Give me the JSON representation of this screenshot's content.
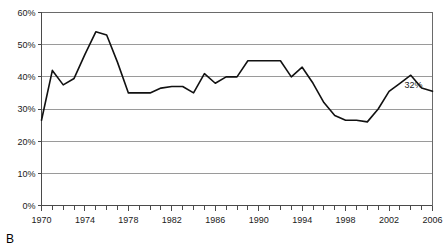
{
  "figure": {
    "panel_label": "B"
  },
  "annotations": [
    {
      "name": "endpoint-value-label",
      "text": "32%",
      "x_year": 2006,
      "y_value": 36.5
    }
  ],
  "chart_data": {
    "type": "line",
    "title": "",
    "xlabel": "",
    "ylabel": "",
    "xlim": [
      1970,
      2006
    ],
    "ylim": [
      0,
      60
    ],
    "grid": true,
    "grid_axis": "y",
    "legend": false,
    "y_ticks": [
      0,
      10,
      20,
      30,
      40,
      50,
      60
    ],
    "y_tick_labels": [
      "0%",
      "10%",
      "20%",
      "30%",
      "40%",
      "50%",
      "60%"
    ],
    "x_ticks": [
      1970,
      1974,
      1978,
      1982,
      1986,
      1990,
      1994,
      1998,
      2002,
      2006
    ],
    "x_tick_labels": [
      "1970",
      "1974",
      "1978",
      "1982",
      "1986",
      "1990",
      "1994",
      "1998",
      "2002",
      "2006"
    ],
    "x_minor_tick_interval": 1,
    "x": [
      1970,
      1971,
      1972,
      1973,
      1974,
      1975,
      1976,
      1977,
      1978,
      1979,
      1980,
      1981,
      1982,
      1983,
      1984,
      1985,
      1986,
      1987,
      1988,
      1989,
      1990,
      1991,
      1992,
      1993,
      1994,
      1995,
      1996,
      1997,
      1998,
      1999,
      2000,
      2001,
      2002,
      2003,
      2004,
      2005,
      2006
    ],
    "values": [
      26.5,
      42.0,
      37.5,
      39.5,
      47.0,
      54.0,
      53.0,
      44.5,
      35.0,
      35.0,
      35.0,
      36.5,
      37.0,
      37.0,
      35.0,
      41.0,
      38.0,
      40.0,
      40.0,
      45.0,
      45.0,
      45.0,
      45.0,
      40.0,
      43.0,
      38.0,
      32.0,
      28.0,
      26.5,
      26.5,
      26.0,
      30.0,
      35.5,
      38.0,
      40.5,
      36.5,
      35.5
    ],
    "series": [
      {
        "name": "series-1",
        "color": "#111111",
        "values": [
          26.5,
          42.0,
          37.5,
          39.5,
          47.0,
          54.0,
          53.0,
          44.5,
          35.0,
          35.0,
          35.0,
          36.5,
          37.0,
          37.0,
          35.0,
          41.0,
          38.0,
          40.0,
          40.0,
          45.0,
          45.0,
          45.0,
          45.0,
          40.0,
          43.0,
          38.0,
          32.0,
          28.0,
          26.5,
          26.5,
          26.0,
          30.0,
          35.5,
          38.0,
          40.5,
          36.5,
          35.5
        ]
      }
    ]
  },
  "colors": {
    "line": "#111111",
    "grid": "#9a9a9a",
    "axis": "#4a4a4a",
    "frame": "#6a6a6a",
    "text": "#1a1a1a",
    "background": "#ffffff"
  }
}
